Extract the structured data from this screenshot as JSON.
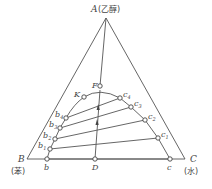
{
  "diagram": {
    "type": "ternary-phase-diagram",
    "vertices": {
      "A": {
        "label": "A",
        "component": "(乙醇)"
      },
      "B": {
        "label": "B",
        "component": "(苯)"
      },
      "C": {
        "label": "C",
        "component": "(水)"
      }
    },
    "points": {
      "F": "F",
      "K": "K",
      "D": "D",
      "b": "b",
      "c": "c",
      "b1": "b",
      "b1_sub": "1",
      "b2": "b",
      "b2_sub": "2",
      "b3": "b",
      "b3_sub": "3",
      "b4": "b",
      "b4_sub": "4",
      "c1": "c",
      "c1_sub": "1",
      "c2": "c",
      "c2_sub": "2",
      "c3": "c",
      "c3_sub": "3",
      "c4": "c",
      "c4_sub": "4"
    },
    "tie_lines": [
      [
        "b",
        "c"
      ],
      [
        "b1",
        "c1"
      ],
      [
        "b2",
        "c2"
      ],
      [
        "b3",
        "c3"
      ],
      [
        "b4",
        "c4"
      ]
    ],
    "colors": {
      "line": "#555555",
      "text": "#444444",
      "background": "#ffffff"
    }
  }
}
